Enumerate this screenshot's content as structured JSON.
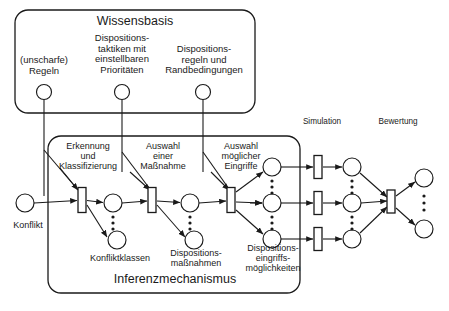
{
  "diagram": {
    "type": "petri-net",
    "title_visible": false,
    "containers": [
      {
        "id": "wissensbasis",
        "label": "Wissensbasis",
        "x": 15,
        "y": 10,
        "w": 240,
        "h": 103,
        "rx": 13
      },
      {
        "id": "inferenzmechanismus",
        "label": "Inferenzmechanismus",
        "x": 48,
        "y": 136,
        "w": 252,
        "h": 157,
        "rx": 13
      }
    ],
    "section_labels": [
      {
        "id": "simulation",
        "text": "Simulation",
        "x": 322,
        "y": 122
      },
      {
        "id": "bewertung",
        "text": "Bewertung",
        "x": 398,
        "y": 122
      }
    ],
    "knowledge_places": [
      {
        "id": "kb-regeln",
        "label": "(unscharfe)\nRegeln",
        "cx": 44,
        "cy": 92,
        "r": 7.5,
        "label_x": 44,
        "label_y": 62
      },
      {
        "id": "kb-taktiken",
        "label": "Dispositions-\ntaktiken mit\neinstellbaren\nPrioritäten",
        "cx": 122,
        "cy": 92,
        "r": 7.5,
        "label_x": 122,
        "label_y": 40
      },
      {
        "id": "kb-regeln-rand",
        "label": "Dispositions-\nregeln und\nRandbedingungen",
        "cx": 203,
        "cy": 92,
        "r": 7.5,
        "label_x": 203,
        "label_y": 51
      }
    ],
    "transition_labels": [
      {
        "id": "t1-label",
        "text": "Erkennung\nund\nKlassifizierung",
        "x": 87,
        "y": 145
      },
      {
        "id": "t2-label",
        "text": "Auswahl\neiner\nMaßnahme",
        "x": 163,
        "y": 145
      },
      {
        "id": "t3-label",
        "text": "Auswahl\nmöglicher\nEingriffe",
        "x": 240,
        "y": 145
      }
    ],
    "place_group_labels": [
      {
        "id": "konflikt-label",
        "text": "Konflikt",
        "x": 26,
        "y": 225
      },
      {
        "id": "konfliktklassen-label",
        "text": "Konfliktklassen",
        "x": 119,
        "y": 258
      },
      {
        "id": "dispositionsmassnahmen-label",
        "text": "Dispositions-\nmaßnahmen",
        "x": 195,
        "y": 254
      },
      {
        "id": "dispositionseingriffe-label",
        "text": "Dispositions-\neingriffs-\nmöglichkeiten",
        "x": 272,
        "y": 254
      }
    ],
    "places": [
      {
        "id": "p-konflikt",
        "cx": 25,
        "cy": 203,
        "r": 9
      },
      {
        "id": "p-konfliktklasse-1",
        "cx": 113,
        "cy": 203,
        "r": 9
      },
      {
        "id": "p-konfliktklasse-n",
        "cx": 117,
        "cy": 240,
        "r": 9
      },
      {
        "id": "p-massnahme-1",
        "cx": 190,
        "cy": 203,
        "r": 9
      },
      {
        "id": "p-massnahme-n",
        "cx": 194,
        "cy": 240,
        "r": 9
      },
      {
        "id": "p-eingriff-oben",
        "cx": 272,
        "cy": 167,
        "r": 9
      },
      {
        "id": "p-eingriff-mitte",
        "cx": 272,
        "cy": 203,
        "r": 9
      },
      {
        "id": "p-eingriff-unten",
        "cx": 272,
        "cy": 239,
        "r": 9
      },
      {
        "id": "p-sim-oben",
        "cx": 352,
        "cy": 167,
        "r": 9
      },
      {
        "id": "p-sim-mitte",
        "cx": 352,
        "cy": 203,
        "r": 9
      },
      {
        "id": "p-sim-unten",
        "cx": 352,
        "cy": 239,
        "r": 9
      },
      {
        "id": "p-bewertung-oben",
        "cx": 424,
        "cy": 178,
        "r": 9
      },
      {
        "id": "p-bewertung-unten",
        "cx": 424,
        "cy": 229,
        "r": 9
      }
    ],
    "transitions": [
      {
        "id": "t-erkennung",
        "cx": 82,
        "cy": 200,
        "w": 8,
        "h": 25
      },
      {
        "id": "t-auswahl-massnahme",
        "cx": 152,
        "cy": 200,
        "w": 8,
        "h": 25
      },
      {
        "id": "t-auswahl-eingriffe",
        "cx": 231,
        "cy": 200,
        "w": 8,
        "h": 25
      },
      {
        "id": "t-sim-oben",
        "cx": 318,
        "cy": 167,
        "w": 8,
        "h": 23
      },
      {
        "id": "t-sim-mitte",
        "cx": 318,
        "cy": 203,
        "w": 8,
        "h": 23
      },
      {
        "id": "t-sim-unten",
        "cx": 318,
        "cy": 239,
        "w": 8,
        "h": 23
      },
      {
        "id": "t-bewertung",
        "cx": 391,
        "cy": 201,
        "w": 8,
        "h": 23
      }
    ],
    "vertical_dots": [
      {
        "id": "dots-konfliktklassen",
        "cx": 113,
        "cy_from": 216,
        "cy_to": 230
      },
      {
        "id": "dots-massnahmen",
        "cx": 190,
        "cy_from": 216,
        "cy_to": 230
      },
      {
        "id": "dots-eingriffe-oben",
        "cx": 272,
        "cy_from": 180,
        "cy_to": 192
      },
      {
        "id": "dots-eingriffe-unten",
        "cx": 272,
        "cy_from": 216,
        "cy_to": 228
      },
      {
        "id": "dots-sim-oben",
        "cx": 352,
        "cy_from": 180,
        "cy_to": 192
      },
      {
        "id": "dots-sim-unten",
        "cx": 352,
        "cy_from": 216,
        "cy_to": 228
      },
      {
        "id": "dots-bewertung",
        "cx": 424,
        "cy_from": 193,
        "cy_to": 214
      }
    ],
    "colors": {
      "stroke": "#1a1a1a",
      "fill": "#ffffff",
      "text": "#1a1a1a",
      "background": "#ffffff"
    }
  }
}
